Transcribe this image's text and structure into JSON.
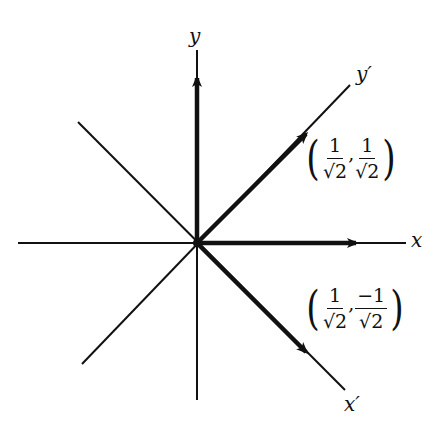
{
  "diagram": {
    "title": "",
    "origin": {
      "x": 197,
      "y": 243
    },
    "axes": {
      "x": {
        "label": "x",
        "from": [
          18,
          243
        ],
        "to": [
          406,
          243
        ]
      },
      "y": {
        "label": "y",
        "from": [
          197,
          50
        ],
        "to": [
          197,
          400
        ]
      },
      "x_prime": {
        "label": "x′",
        "from": [
          82,
          122
        ],
        "to": [
          345,
          390
        ]
      },
      "y_prime": {
        "label": "y′",
        "from": [
          82,
          364
        ],
        "to": [
          350,
          85
        ]
      }
    },
    "vectors": [
      {
        "name": "e_x",
        "from": [
          197,
          243
        ],
        "to": [
          355,
          243
        ],
        "label": ""
      },
      {
        "name": "e_y",
        "from": [
          197,
          243
        ],
        "to": [
          197,
          80
        ],
        "label": ""
      },
      {
        "name": "e_y_prime",
        "from": [
          197,
          243
        ],
        "to": [
          306,
          134
        ],
        "label": "(1/√2, 1/√2)"
      },
      {
        "name": "e_x_prime",
        "from": [
          197,
          243
        ],
        "to": [
          306,
          352
        ],
        "label": "(1/√2, −1/√2)"
      }
    ],
    "labels": {
      "x": "x",
      "y": "y",
      "x_prime": "x′",
      "y_prime": "y′"
    },
    "coord_upper": {
      "open": "(",
      "close": ")",
      "comma": ",",
      "first": {
        "num": "1",
        "den": "√2"
      },
      "second": {
        "num": "1",
        "den": "√2"
      }
    },
    "coord_lower": {
      "open": "(",
      "close": ")",
      "comma": ",",
      "first": {
        "num": "1",
        "den": "√2"
      },
      "second": {
        "num": "−1",
        "den": "√2"
      }
    },
    "colors": {
      "ink": "#111111",
      "background": "#ffffff"
    }
  }
}
